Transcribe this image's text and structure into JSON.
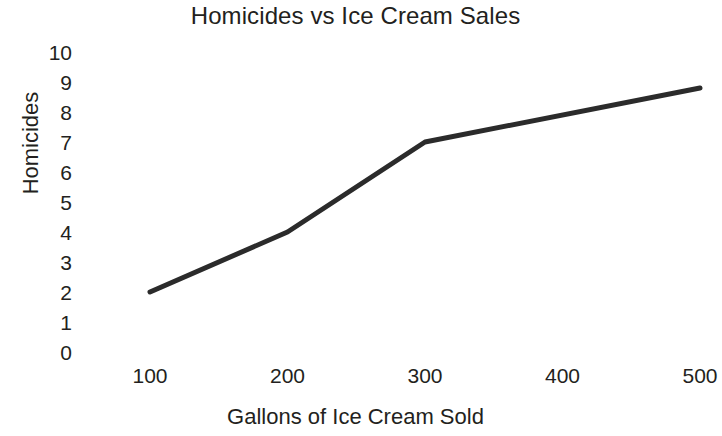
{
  "chart_data": {
    "type": "line",
    "title": "Homicides vs Ice Cream Sales",
    "xlabel": "Gallons of Ice Cream Sold",
    "ylabel": "Homicides",
    "x": [
      100,
      200,
      300,
      500
    ],
    "values": [
      2,
      4,
      7,
      8.8
    ],
    "series": [
      {
        "name": "Homicides",
        "x": [
          100,
          200,
          300,
          500
        ],
        "values": [
          2,
          4,
          7,
          8.8
        ],
        "color": "#2b2b2b",
        "line_width": 5
      }
    ],
    "xlim": [
      100,
      500
    ],
    "ylim": [
      0,
      10
    ],
    "x_ticks": [
      100,
      200,
      300,
      400,
      500
    ],
    "x_tick_labels": [
      "100",
      "200",
      "300",
      "400",
      "500"
    ],
    "y_ticks": [
      0,
      1,
      2,
      3,
      4,
      5,
      6,
      7,
      8,
      9,
      10
    ],
    "y_tick_labels": [
      "10",
      "9",
      "8",
      "7",
      "6",
      "5",
      "4",
      "3",
      "2",
      "1",
      "0"
    ],
    "grid": false,
    "legend": false,
    "markers": false,
    "background_color": "#ffffff",
    "text_color": "#231f20"
  }
}
